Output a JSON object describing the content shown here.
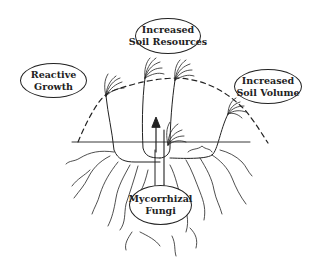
{
  "diagram": {
    "labels": {
      "soil_resources": [
        "Increased",
        "Soil Resources"
      ],
      "reactive_growth": [
        "Reactive",
        "Growth"
      ],
      "soil_volume": [
        "Increased",
        "Soil Volume"
      ],
      "mycorrhizal": [
        "Mycorrhizal",
        "Fungi"
      ]
    },
    "colors": {
      "ink": "#222222",
      "background": "#ffffff"
    }
  }
}
